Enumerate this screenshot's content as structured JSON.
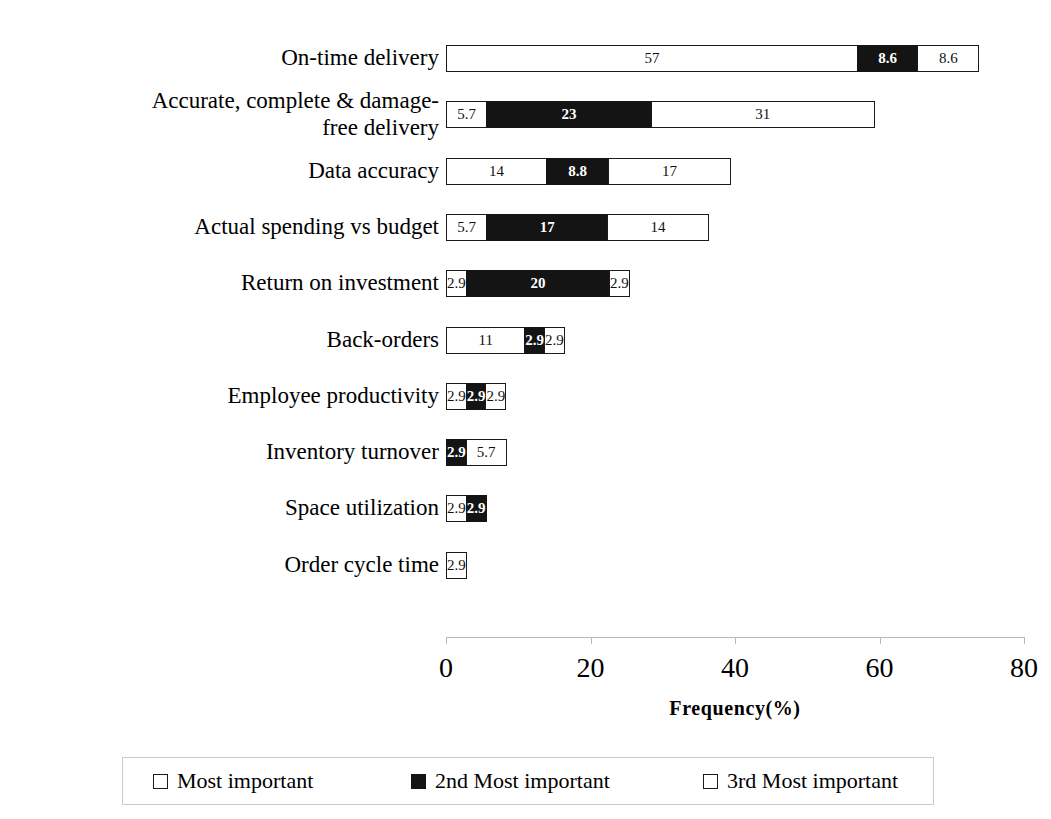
{
  "chart_data": {
    "type": "bar",
    "orientation": "horizontal",
    "stacked": true,
    "title": "",
    "xlabel": "Frequency(%)",
    "ylabel": "",
    "xlim": [
      0,
      80
    ],
    "xticks": [
      0,
      20,
      40,
      60,
      80
    ],
    "xtick_labels": [
      "0",
      "20",
      "40",
      "60",
      "80"
    ],
    "grid": false,
    "legend_position": "bottom",
    "categories": [
      "On-time delivery",
      "Accurate, complete & damage-\nfree delivery",
      "Data accuracy",
      "Actual spending vs budget",
      "Return on investment",
      "Back-orders",
      "Employee productivity",
      "Inventory turnover",
      "Space utilization",
      "Order cycle time"
    ],
    "series": [
      {
        "name": "Most important",
        "color": "#ffffff",
        "values": [
          57,
          5.7,
          14,
          5.7,
          2.9,
          11,
          2.9,
          0,
          2.9,
          2.9
        ]
      },
      {
        "name": "2nd  Most important",
        "color": "#141414",
        "values": [
          8.6,
          23,
          8.8,
          17,
          20,
          2.9,
          2.9,
          2.9,
          2.9,
          0
        ]
      },
      {
        "name": "3rd  Most important",
        "color": "#ffffff",
        "values": [
          8.6,
          31,
          17,
          14,
          2.9,
          2.9,
          2.9,
          5.7,
          0,
          0
        ]
      }
    ],
    "bars": [
      {
        "category": "On-time delivery",
        "segments": [
          {
            "series": "Most important",
            "value": 57,
            "label": "57",
            "fill": "white"
          },
          {
            "series": "2nd  Most important",
            "value": 8.6,
            "label": "8.6",
            "fill": "black"
          },
          {
            "series": "3rd  Most important",
            "value": 8.6,
            "label": "8.6",
            "fill": "white"
          }
        ]
      },
      {
        "category": "Accurate, complete & damage-\nfree delivery",
        "segments": [
          {
            "series": "Most important",
            "value": 5.7,
            "label": "5.7",
            "fill": "white"
          },
          {
            "series": "2nd  Most important",
            "value": 23,
            "label": "23",
            "fill": "black"
          },
          {
            "series": "3rd  Most important",
            "value": 31,
            "label": "31",
            "fill": "white"
          }
        ]
      },
      {
        "category": "Data accuracy",
        "segments": [
          {
            "series": "Most important",
            "value": 14,
            "label": "14",
            "fill": "white"
          },
          {
            "series": "2nd  Most important",
            "value": 8.8,
            "label": "8.8",
            "fill": "black"
          },
          {
            "series": "3rd  Most important",
            "value": 17,
            "label": "17",
            "fill": "white"
          }
        ]
      },
      {
        "category": "Actual spending vs budget",
        "segments": [
          {
            "series": "Most important",
            "value": 5.7,
            "label": "5.7",
            "fill": "white"
          },
          {
            "series": "2nd  Most important",
            "value": 17,
            "label": "17",
            "fill": "black"
          },
          {
            "series": "3rd  Most important",
            "value": 14,
            "label": "14",
            "fill": "white"
          }
        ]
      },
      {
        "category": "Return on investment",
        "segments": [
          {
            "series": "Most important",
            "value": 2.9,
            "label": "2.9",
            "fill": "white"
          },
          {
            "series": "2nd  Most important",
            "value": 20,
            "label": "20",
            "fill": "black"
          },
          {
            "series": "3rd  Most important",
            "value": 2.9,
            "label": "2.9",
            "fill": "white"
          }
        ]
      },
      {
        "category": "Back-orders",
        "segments": [
          {
            "series": "Most important",
            "value": 11,
            "label": "11",
            "fill": "white"
          },
          {
            "series": "2nd  Most important",
            "value": 2.9,
            "label": "2.9",
            "fill": "black"
          },
          {
            "series": "3rd  Most important",
            "value": 2.9,
            "label": "2.9",
            "fill": "white"
          }
        ]
      },
      {
        "category": "Employee productivity",
        "segments": [
          {
            "series": "Most important",
            "value": 2.9,
            "label": "2.9",
            "fill": "white"
          },
          {
            "series": "2nd  Most important",
            "value": 2.9,
            "label": "2.9",
            "fill": "black"
          },
          {
            "series": "3rd  Most important",
            "value": 2.9,
            "label": "2.9",
            "fill": "white"
          }
        ]
      },
      {
        "category": "Inventory turnover",
        "segments": [
          {
            "series": "2nd  Most important",
            "value": 2.9,
            "label": "2.9",
            "fill": "black"
          },
          {
            "series": "3rd  Most important",
            "value": 5.7,
            "label": "5.7",
            "fill": "white"
          }
        ]
      },
      {
        "category": "Space utilization",
        "segments": [
          {
            "series": "Most important",
            "value": 2.9,
            "label": "2.9",
            "fill": "white"
          },
          {
            "series": "2nd  Most important",
            "value": 2.9,
            "label": "2.9",
            "fill": "black"
          }
        ]
      },
      {
        "category": "Order cycle time",
        "segments": [
          {
            "series": "Most important",
            "value": 2.9,
            "label": "2.9",
            "fill": "white"
          }
        ]
      }
    ],
    "legend": [
      {
        "label": "Most important",
        "fill": "white"
      },
      {
        "label": "2nd  Most important",
        "fill": "black"
      },
      {
        "label": "3rd  Most important",
        "fill": "white"
      }
    ]
  }
}
